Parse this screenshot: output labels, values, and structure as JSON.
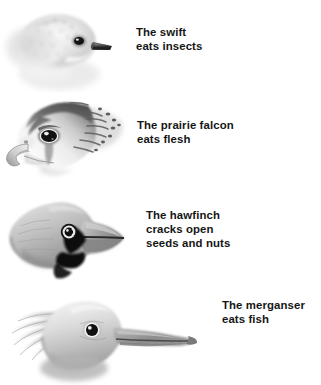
{
  "page": {
    "background_color": "#ffffff",
    "text_color": "#161616",
    "width": 321,
    "height": 385
  },
  "entries": [
    {
      "id": "swift",
      "bird": "swift",
      "caption": "The swift\neats insects",
      "caption_line1": "The swift",
      "caption_line2": "eats insects",
      "illustration_name": "swift-head-illustration",
      "beak_type": "small short gape",
      "diet": "insects",
      "facing": "right"
    },
    {
      "id": "falcon",
      "bird": "prairie falcon",
      "caption": "The prairie falcon\neats flesh",
      "caption_line1": "The prairie falcon",
      "caption_line2": "eats flesh",
      "illustration_name": "prairie-falcon-head-illustration",
      "beak_type": "hooked raptor bill",
      "diet": "flesh",
      "facing": "left"
    },
    {
      "id": "hawfinch",
      "bird": "hawfinch",
      "caption": "The hawfinch\ncracks open\nseeds and nuts",
      "caption_line1": "The hawfinch",
      "caption_line2": "cracks open",
      "caption_line3": "seeds and nuts",
      "illustration_name": "hawfinch-head-illustration",
      "beak_type": "massive conical bill",
      "diet": "seeds and nuts",
      "facing": "right"
    },
    {
      "id": "merganser",
      "bird": "merganser",
      "caption": "The merganser\neats fish",
      "caption_line1": "The merganser",
      "caption_line2": "eats fish",
      "illustration_name": "merganser-head-illustration",
      "beak_type": "long serrated bill",
      "diet": "fish",
      "facing": "right"
    }
  ],
  "palette": {
    "ink_dark": "#1c1c1c",
    "ink_mid": "#6f6f6f",
    "ink_light": "#b9b9b9",
    "ink_pale": "#dcdcdc",
    "paper": "#ffffff"
  }
}
